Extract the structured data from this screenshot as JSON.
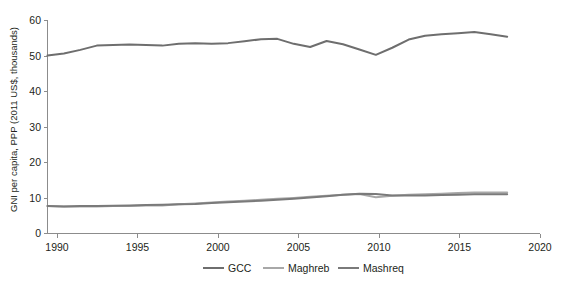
{
  "chart_data": {
    "type": "line",
    "title": "",
    "subtitle": "",
    "xlabel": "",
    "ylabel": "GNI per capita, PPP (2011 US$, thousands)",
    "xlim": [
      1990,
      2020
    ],
    "ylim": [
      0,
      60
    ],
    "x_ticks": [
      1990,
      1995,
      2000,
      2005,
      2010,
      2015,
      2020
    ],
    "y_ticks": [
      0,
      10,
      20,
      30,
      40,
      50,
      60
    ],
    "grid": false,
    "legend_position": "bottom-center",
    "x": [
      1990,
      1991,
      1992,
      1993,
      1994,
      1995,
      1996,
      1997,
      1998,
      1999,
      2000,
      2001,
      2002,
      2003,
      2004,
      2005,
      2006,
      2007,
      2008,
      2009,
      2010,
      2011,
      2012,
      2013,
      2014,
      2015,
      2016,
      2017,
      2018
    ],
    "series": [
      {
        "name": "GCC",
        "color": "#6e6e6e",
        "values": [
          50.0,
          50.6,
          51.6,
          52.8,
          53.0,
          53.1,
          53.0,
          52.8,
          53.3,
          53.5,
          53.3,
          53.5,
          54.0,
          54.6,
          54.7,
          53.3,
          52.4,
          54.1,
          53.2,
          51.7,
          50.2,
          52.2,
          54.5,
          55.6,
          56.0,
          56.3,
          56.6,
          56.0,
          55.3
        ]
      },
      {
        "name": "Maghreb",
        "color": "#a8a8a8",
        "values": [
          7.7,
          7.6,
          7.6,
          7.6,
          7.7,
          7.7,
          7.9,
          7.9,
          8.2,
          8.4,
          8.7,
          9.0,
          9.2,
          9.5,
          9.8,
          10.0,
          10.3,
          10.6,
          10.9,
          11.1,
          10.2,
          10.6,
          10.9,
          11.0,
          11.2,
          11.4,
          11.5,
          11.5,
          11.5
        ]
      },
      {
        "name": "Mashreq",
        "color": "#7a7a7a",
        "values": [
          7.7,
          7.6,
          7.7,
          7.7,
          7.8,
          7.9,
          8.0,
          8.1,
          8.2,
          8.3,
          8.6,
          8.8,
          9.0,
          9.2,
          9.5,
          9.8,
          10.1,
          10.5,
          10.9,
          11.2,
          11.1,
          10.7,
          10.7,
          10.7,
          10.8,
          10.9,
          11.0,
          11.0,
          11.0
        ]
      }
    ]
  },
  "axis": {
    "y_label": "GNI per capita, PPP (2011 US$, thousands)",
    "y_tick_labels": [
      "0",
      "10",
      "20",
      "30",
      "40",
      "50",
      "60"
    ],
    "x_tick_labels": [
      "1990",
      "1995",
      "2000",
      "2005",
      "2010",
      "2015",
      "2020"
    ]
  },
  "legend": {
    "items": [
      {
        "label": "GCC",
        "color": "#6e6e6e"
      },
      {
        "label": "Maghreb",
        "color": "#a8a8a8"
      },
      {
        "label": "Mashreq",
        "color": "#7a7a7a"
      }
    ]
  }
}
